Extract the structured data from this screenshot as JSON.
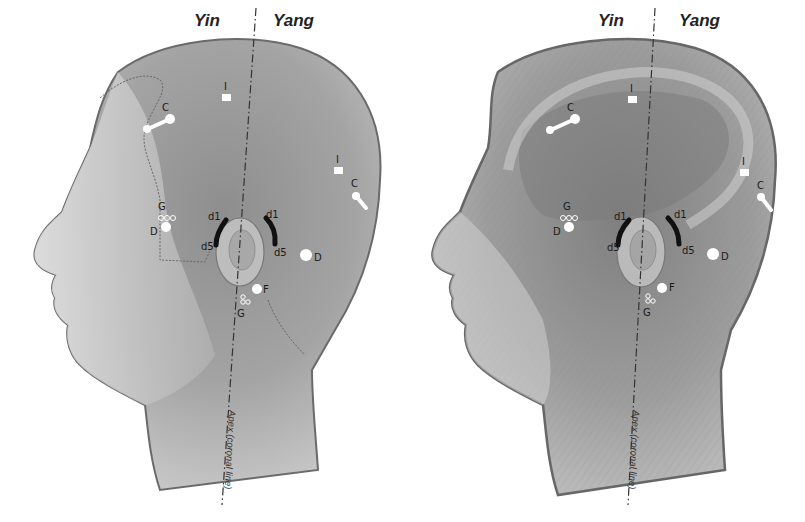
{
  "figure": {
    "panels": [
      {
        "id": "left",
        "style": "skin",
        "headers": {
          "yin": "Yin",
          "yang": "Yang"
        },
        "axis_label": "Apex (coronal line)",
        "markers": {
          "C_front": "C",
          "I_top": "I",
          "I_back": "I",
          "C_back": "C",
          "G_temple": "G",
          "D_temple": "D",
          "d1_front": "d1",
          "d5_front": "d5",
          "d1_back": "d1",
          "d5_back": "d5",
          "D_back": "D",
          "F": "F",
          "G_lower": "G"
        }
      },
      {
        "id": "right",
        "style": "muscle",
        "headers": {
          "yin": "Yin",
          "yang": "Yang"
        },
        "axis_label": "Apex (coronal line)",
        "markers": {
          "C_front": "C",
          "I_top": "I",
          "I_back": "I",
          "C_back": "C",
          "G_temple": "G",
          "D_temple": "D",
          "d1_front": "d1",
          "d5_front": "d5",
          "d1_back": "d1",
          "d5_back": "d5",
          "D_back": "D",
          "F": "F",
          "G_lower": "G"
        }
      }
    ],
    "colors": {
      "background": "#ffffff",
      "skin_light": "#d4d4d4",
      "skin_mid": "#a6a6a6",
      "skin_dark": "#7d7d7d",
      "outline": "#555555",
      "marker_fill": "#ffffff",
      "arc_marker": "#111111",
      "text": "#1a1a1a"
    }
  }
}
